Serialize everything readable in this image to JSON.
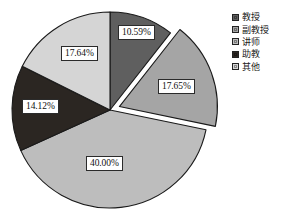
{
  "chart_data": {
    "type": "pie",
    "title": "",
    "subtitle": "",
    "xlabel": "",
    "ylabel": "",
    "grid": false,
    "legend_position": "right",
    "start_angle_deg": 0,
    "direction": "clockwise",
    "center": {
      "x": 110,
      "y": 110
    },
    "radius": 98,
    "categories": [
      "教授",
      "副教授",
      "讲师",
      "助教",
      "其他"
    ],
    "values": [
      10.59,
      17.65,
      40.0,
      14.12,
      17.64
    ],
    "value_unit": "%",
    "data_labels": [
      "10.59%",
      "17.65%",
      "40.00%",
      "14.12%",
      "17.64%"
    ],
    "colors": [
      "#5f5f5f",
      "#a5a5a5",
      "#bdbdbd",
      "#2b2622",
      "#d5d5d5"
    ],
    "exploded": [
      false,
      true,
      false,
      false,
      false
    ],
    "explode_offset": 10,
    "slices": [
      {
        "label": "教授",
        "value": 10.59,
        "data_label": "10.59%",
        "color": "#5f5f5f",
        "exploded": false,
        "start_deg": 0,
        "end_deg": 38.124
      },
      {
        "label": "副教授",
        "value": 17.65,
        "data_label": "17.65%",
        "color": "#a5a5a5",
        "exploded": true,
        "start_deg": 38.124,
        "end_deg": 101.664
      },
      {
        "label": "讲师",
        "value": 40.0,
        "data_label": "40.00%",
        "color": "#bdbdbd",
        "exploded": false,
        "start_deg": 101.664,
        "end_deg": 245.664
      },
      {
        "label": "助教",
        "value": 14.12,
        "data_label": "14.12%",
        "color": "#2b2622",
        "exploded": false,
        "start_deg": 245.664,
        "end_deg": 296.496
      },
      {
        "label": "其他",
        "value": 17.64,
        "data_label": "17.64%",
        "color": "#d5d5d5",
        "exploded": false,
        "start_deg": 296.496,
        "end_deg": 360
      }
    ],
    "label_positions": [
      {
        "x": 118,
        "y": 25
      },
      {
        "x": 158,
        "y": 79
      },
      {
        "x": 86,
        "y": 156
      },
      {
        "x": 22,
        "y": 99
      },
      {
        "x": 61,
        "y": 46
      }
    ]
  },
  "legend": {
    "items": [
      {
        "label": "教授",
        "color": "#5f5f5f"
      },
      {
        "label": "副教授",
        "color": "#a5a5a5"
      },
      {
        "label": "讲师",
        "color": "#bdbdbd"
      },
      {
        "label": "助教",
        "color": "#2b2622"
      },
      {
        "label": "其他",
        "color": "#d5d5d5"
      }
    ]
  }
}
